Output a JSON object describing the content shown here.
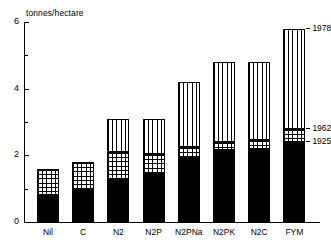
{
  "chart_data": {
    "type": "bar",
    "title": "",
    "subtitle": "",
    "xlabel": "",
    "ylabel": "tonnes/hectare",
    "ylim": [
      0,
      6
    ],
    "ytick_labels": [
      "0",
      "2",
      "4",
      "6"
    ],
    "ytick_values": [
      0,
      2,
      4,
      6
    ],
    "yminor_values": [
      1,
      3,
      5
    ],
    "grid": false,
    "legend_position": "right-inline-annotations",
    "stacked": true,
    "stack_mode": "cumulative-top",
    "categories": [
      "Nil",
      "C",
      "N2",
      "N2P",
      "N2PNa",
      "N2PK",
      "N2C",
      "FYM"
    ],
    "series": [
      {
        "name": "1925",
        "fill": "solid-black",
        "color": "#000000",
        "values": [
          0.8,
          1.0,
          1.3,
          1.45,
          1.95,
          2.15,
          2.2,
          2.4
        ]
      },
      {
        "name": "1962",
        "fill": "cross-hatch",
        "color": "#ffffff",
        "values": [
          1.6,
          1.8,
          2.1,
          2.05,
          2.25,
          2.4,
          2.45,
          2.8
        ]
      },
      {
        "name": "1978",
        "fill": "vertical-lines",
        "color": "#ffffff",
        "values": [
          1.6,
          1.8,
          3.1,
          3.1,
          4.2,
          4.8,
          4.8,
          5.8
        ]
      }
    ],
    "annotations": [
      {
        "label": "1978",
        "value": 5.8,
        "anchor_category": "FYM"
      },
      {
        "label": "1962",
        "value": 2.8,
        "anchor_category": "FYM"
      },
      {
        "label": "1925",
        "value": 2.4,
        "anchor_category": "FYM"
      }
    ]
  }
}
